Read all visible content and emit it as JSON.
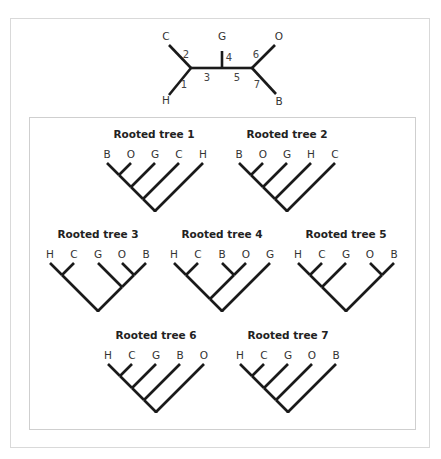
{
  "unrooted_tree": {
    "taxa": [
      {
        "name": "C",
        "x": 166,
        "y": 40
      },
      {
        "name": "H",
        "x": 166,
        "y": 104
      },
      {
        "name": "G",
        "x": 222,
        "y": 40
      },
      {
        "name": "O",
        "x": 279,
        "y": 40
      },
      {
        "name": "B",
        "x": 279,
        "y": 105
      }
    ],
    "edges": [
      {
        "num": "1",
        "from": [
          191,
          68
        ],
        "to": [
          169,
          95
        ],
        "label_pos": [
          184,
          88
        ]
      },
      {
        "num": "2",
        "from": [
          191,
          68
        ],
        "to": [
          169,
          45
        ],
        "label_pos": [
          186,
          58
        ]
      },
      {
        "num": "3",
        "from": [
          191,
          68
        ],
        "to": [
          222,
          68
        ],
        "label_pos": [
          207,
          81
        ]
      },
      {
        "num": "4",
        "from": [
          222,
          68
        ],
        "to": [
          222,
          51
        ],
        "label_pos": [
          229,
          61
        ]
      },
      {
        "num": "5",
        "from": [
          222,
          68
        ],
        "to": [
          252,
          68
        ],
        "label_pos": [
          237,
          81
        ]
      },
      {
        "num": "6",
        "from": [
          252,
          68
        ],
        "to": [
          275,
          45
        ],
        "label_pos": [
          256,
          58
        ]
      },
      {
        "num": "7",
        "from": [
          252,
          68
        ],
        "to": [
          276,
          94
        ],
        "label_pos": [
          257,
          88
        ]
      }
    ]
  },
  "rooted_trees": [
    {
      "title": "Rooted tree 1",
      "title_pos": [
        154,
        138
      ],
      "tip_y": 163,
      "label_y": 158,
      "tip_spacing": 24,
      "first_x": 107,
      "taxa": [
        "B",
        "O",
        "G",
        "C",
        "H"
      ],
      "newick": "((((B,O),G),C),H)"
    },
    {
      "title": "Rooted tree 2",
      "title_pos": [
        287,
        138
      ],
      "tip_y": 163,
      "label_y": 158,
      "tip_spacing": 24,
      "first_x": 239,
      "taxa": [
        "B",
        "O",
        "G",
        "H",
        "C"
      ],
      "newick": "((((B,O),G),H),C)"
    },
    {
      "title": "Rooted tree 3",
      "title_pos": [
        98,
        238
      ],
      "tip_y": 263,
      "label_y": 258,
      "tip_spacing": 24,
      "first_x": 50,
      "taxa": [
        "H",
        "C",
        "G",
        "O",
        "B"
      ],
      "newick": "((H,C),(G,(O,B)))"
    },
    {
      "title": "Rooted tree 4",
      "title_pos": [
        222,
        238
      ],
      "tip_y": 263,
      "label_y": 258,
      "tip_spacing": 24,
      "first_x": 174,
      "taxa": [
        "H",
        "C",
        "B",
        "O",
        "G"
      ],
      "newick": "(((H,C),(B,O)),G)"
    },
    {
      "title": "Rooted tree 5",
      "title_pos": [
        346,
        238
      ],
      "tip_y": 263,
      "label_y": 258,
      "tip_spacing": 24,
      "first_x": 298,
      "taxa": [
        "H",
        "C",
        "G",
        "O",
        "B"
      ],
      "newick": "(((H,C),G),(O,B))"
    },
    {
      "title": "Rooted tree 6",
      "title_pos": [
        156,
        339
      ],
      "tip_y": 364,
      "label_y": 359,
      "tip_spacing": 24,
      "first_x": 108,
      "taxa": [
        "H",
        "C",
        "G",
        "B",
        "O"
      ],
      "newick": "((((H,C),G),B),O)"
    },
    {
      "title": "Rooted tree 7",
      "title_pos": [
        288,
        339
      ],
      "tip_y": 364,
      "label_y": 359,
      "tip_spacing": 24,
      "first_x": 240,
      "taxa": [
        "H",
        "C",
        "G",
        "O",
        "B"
      ],
      "newick": "((((H,C),G),O),B)"
    }
  ],
  "colors": {
    "branch": "#1a1a1a",
    "label": "#333333",
    "frame": "#d9d9d9"
  }
}
